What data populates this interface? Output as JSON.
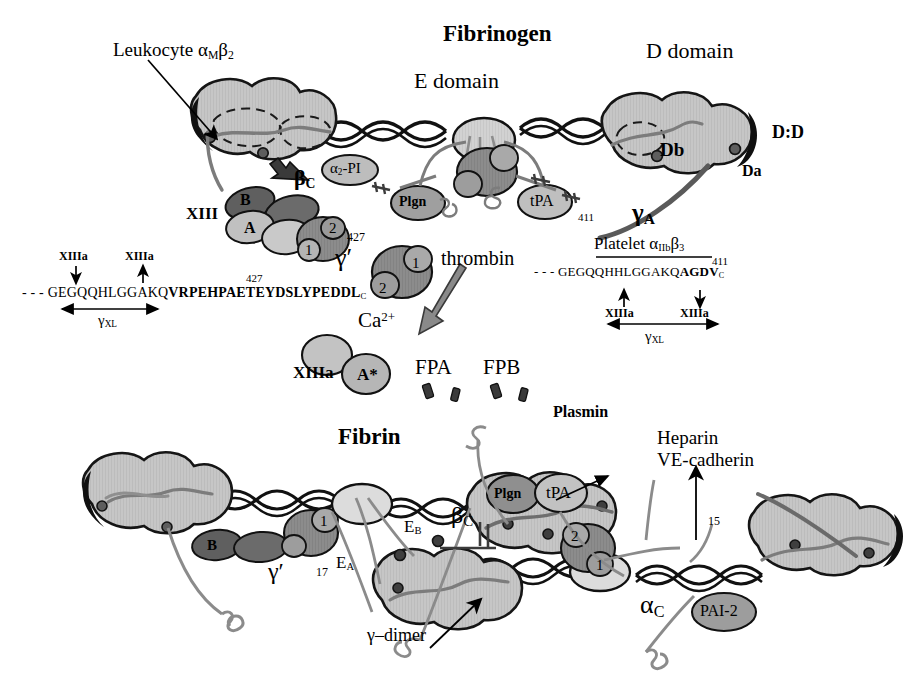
{
  "figure": {
    "title_top": "Fibrinogen",
    "title_bottom": "Fibrin"
  },
  "top_panel": {
    "e_domain_label": "E domain",
    "d_domain_label": "D domain",
    "leukocyte_label": "Leukocyte α",
    "leukocyte_sub1": "M",
    "leukocyte_beta": "β",
    "leukocyte_sub2": "2",
    "beta_c": "β",
    "beta_c_sub": "C",
    "alpha2_pi": "α",
    "alpha2_pi_sub": "2",
    "alpha2_pi_rest": "-PI",
    "plgn": "Plgn",
    "tpa": "tPA",
    "xiii": "XIII",
    "subunit_a": "A",
    "subunit_b": "B",
    "lobe_1": "1",
    "lobe_2": "2",
    "db": "Db",
    "da": "Da",
    "dd": "D:D",
    "gamma_prime": "γ′",
    "gamma_a": "γ",
    "gamma_a_sub": "A",
    "res_427": "427",
    "res_411": "411"
  },
  "center": {
    "thrombin": "thrombin",
    "calcium": "Ca",
    "calcium_sup": "2+",
    "xiiia": "XIIIa",
    "a_star": "A*",
    "fpa": "FPA",
    "fpb": "FPB",
    "lobe_1": "1",
    "lobe_2": "2"
  },
  "left_sequence": {
    "arrow_label_1": "XIIIa",
    "arrow_label_2": "XIIIa",
    "dashes": "- - -",
    "plain": "GEGQQHLGGAKQ",
    "bold": "VRPEHPAETEYDSLYPEDDL",
    "terminal_sub": "C",
    "superscript": "427",
    "span_label": "γ",
    "span_sub": "XL"
  },
  "right_sequence": {
    "platelet_label": "Platelet  α",
    "platelet_sub1": "IIb",
    "platelet_beta": "β",
    "platelet_sub2": "3",
    "dashes": "- - -",
    "plain": "GEGQQHHLGGAKQ",
    "bold": "AGDV",
    "terminal_sub": "C",
    "superscript": "411",
    "arrow_label_1": "XIIIa",
    "arrow_label_2": "XIIIa",
    "span_label": "γ",
    "span_sub": "XL"
  },
  "bottom_panel": {
    "plasmin": "Plasmin",
    "heparin": "Heparin",
    "ve_cadherin": "VE-cadherin",
    "plgn": "Plgn",
    "tpa": "tPA",
    "pai2": "PAI-2",
    "alpha_c": "α",
    "alpha_c_sub": "C",
    "beta_c": "β",
    "beta_c_sub": "C",
    "e_a": "E",
    "e_a_sub": "A",
    "e_b": "E",
    "e_b_sub": "B",
    "gamma_dimer": "γ–dimer",
    "gamma_prime": "γ′",
    "subunit_b": "B",
    "res_17": "17",
    "res_15": "15",
    "lobe_1": "1",
    "lobe_2": "2"
  },
  "colors": {
    "background": "#ffffff",
    "domain_fill": "#c6c6c6",
    "domain_stroke": "#1a1a1a",
    "nodule_light": "#d2d2d2",
    "protease_dark": "#8c8c8c",
    "protease_darker": "#6f6f6f",
    "subunit_dark": "#6b6b6b",
    "chain_gray": "#7a7a7a",
    "chain_dark": "#5a5a5a",
    "text": "#000000"
  }
}
